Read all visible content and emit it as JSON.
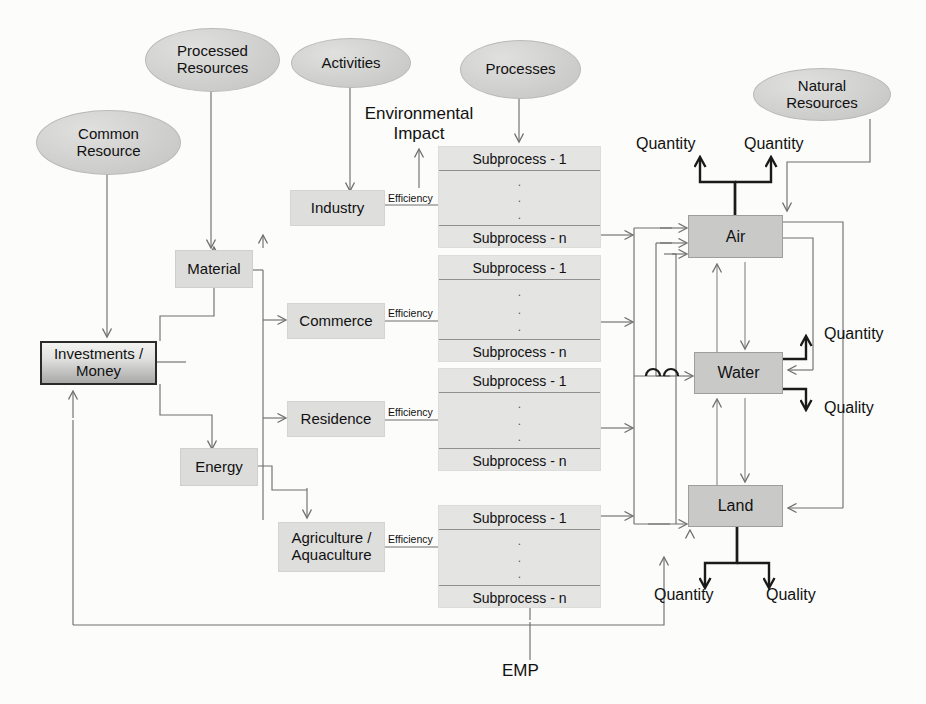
{
  "diagram": {
    "colors": {
      "ellipse_fill": "#d3d3d2",
      "box_fill": "#dedede",
      "env_fill": "#c9c9c8",
      "line": "#6f6f6f",
      "thick_line": "#1a1a1a",
      "text": "#111111"
    }
  },
  "ellipses": [
    {
      "id": "processed-resources",
      "label": "Processed\nResources",
      "line1": "Processed",
      "line2": "Resources"
    },
    {
      "id": "activities",
      "label": "Activities",
      "line1": "Activities",
      "line2": ""
    },
    {
      "id": "common-resource",
      "label": "Common\nResource",
      "line1": "Common",
      "line2": "Resource"
    },
    {
      "id": "processes",
      "label": "Processes",
      "line1": "Processes",
      "line2": ""
    },
    {
      "id": "natural-resources",
      "label": "Natural\nResources",
      "line1": "Natural",
      "line2": "Resources"
    }
  ],
  "boxes": {
    "money": {
      "line1": "Investments /",
      "line2": "Money"
    },
    "material": {
      "label": "Material"
    },
    "energy": {
      "label": "Energy"
    },
    "industry": {
      "label": "Industry"
    },
    "commerce": {
      "label": "Commerce"
    },
    "residence": {
      "label": "Residence"
    },
    "agriculture": {
      "line1": "Agriculture /",
      "line2": "Aquaculture"
    }
  },
  "environment": {
    "air": {
      "label": "Air"
    },
    "water": {
      "label": "Water"
    },
    "land": {
      "label": "Land"
    }
  },
  "efficiency_labels": [
    {
      "for": "industry",
      "label": "Efficiency"
    },
    {
      "for": "commerce",
      "label": "Efficiency"
    },
    {
      "for": "residence",
      "label": "Efficiency"
    },
    {
      "for": "agriculture",
      "label": "Efficiency"
    }
  ],
  "subprocess_blocks": [
    {
      "id": "industry-processes",
      "first": "Subprocess - 1",
      "last": "Subprocess - n"
    },
    {
      "id": "commerce-processes",
      "first": "Subprocess - 1",
      "last": "Subprocess - n"
    },
    {
      "id": "residence-processes",
      "first": "Subprocess - 1",
      "last": "Subprocess - n"
    },
    {
      "id": "agriculture-processes",
      "first": "Subprocess - 1",
      "last": "Subprocess - n"
    }
  ],
  "annotations": {
    "environmental_impact_l1": "Environmental",
    "environmental_impact_l2": "Impact",
    "air_quantity_left": "Quantity",
    "air_quantity_right": "Quantity",
    "water_quantity": "Quantity",
    "water_quality": "Quality",
    "land_quantity": "Quantity",
    "land_quality": "Quality",
    "emp": "EMP"
  }
}
